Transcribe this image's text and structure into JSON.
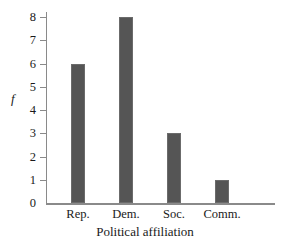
{
  "chart_data": {
    "type": "bar",
    "title": "",
    "subtitle": "",
    "categories": [
      "Rep.",
      "Dem.",
      "Soc.",
      "Comm."
    ],
    "values": [
      6,
      8,
      3,
      1
    ],
    "series": [
      {
        "name": "f",
        "values": [
          6,
          8,
          3,
          1
        ]
      }
    ],
    "xlabel": "Political affiliation",
    "ylabel": "f",
    "ylim": [
      0,
      8
    ],
    "xlim": null,
    "y_ticks": [
      0,
      1,
      2,
      3,
      4,
      5,
      6,
      7,
      8
    ],
    "y_tick_labels": [
      "0",
      "1",
      "2",
      "3",
      "4",
      "5",
      "6",
      "7",
      "8"
    ],
    "x_tick_labels": [
      "Rep.",
      "Dem.",
      "Soc.",
      "Comm."
    ],
    "grid": false,
    "legend": false,
    "legend_position": "none",
    "annotations": [],
    "colors": {
      "bar_fill": "#555555",
      "bar_border": "#6b6b6b",
      "axis": "#8a8a8a",
      "text": "#1a1a1a",
      "background": "#ffffff"
    }
  },
  "axis": {
    "y_title": "f",
    "x_title": "Political affiliation"
  }
}
